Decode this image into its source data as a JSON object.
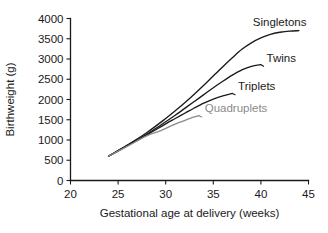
{
  "chart_data": {
    "type": "line",
    "title": "",
    "xlabel": "Gestational age at delivery (weeks)",
    "ylabel": "Birthweight (g)",
    "xlim": [
      20,
      45
    ],
    "ylim": [
      0,
      4000
    ],
    "xticks": [
      "20",
      "25",
      "30",
      "35",
      "40",
      "45"
    ],
    "yticks": [
      "0",
      "500",
      "1000",
      "1500",
      "2000",
      "2500",
      "3000",
      "3500",
      "4000"
    ],
    "grid": false,
    "legend_position": "inline-end-of-line-labels",
    "series": [
      {
        "name": "Singletons",
        "color": "#1a1a1a",
        "label_color": "#1a1a1a",
        "x": [
          24,
          26,
          28,
          30,
          31,
          32,
          33,
          34,
          35,
          36,
          37,
          38,
          39,
          40,
          41,
          42,
          43,
          44
        ],
        "values": [
          600,
          880,
          1180,
          1530,
          1720,
          1920,
          2130,
          2350,
          2580,
          2810,
          3030,
          3240,
          3400,
          3520,
          3610,
          3660,
          3690,
          3700
        ]
      },
      {
        "name": "Twins",
        "color": "#1a1a1a",
        "label_color": "#1a1a1a",
        "x": [
          24,
          26,
          28,
          30,
          31,
          32,
          33,
          34,
          35,
          36,
          37,
          38,
          39,
          40
        ],
        "values": [
          600,
          870,
          1140,
          1450,
          1610,
          1780,
          1950,
          2120,
          2290,
          2450,
          2600,
          2730,
          2820,
          2860
        ]
      },
      {
        "name": "Triplets",
        "color": "#1a1a1a",
        "label_color": "#1a1a1a",
        "x": [
          24,
          26,
          28,
          30,
          31,
          32,
          33,
          34,
          35,
          36,
          37
        ],
        "values": [
          600,
          860,
          1120,
          1400,
          1530,
          1660,
          1790,
          1910,
          2010,
          2090,
          2150
        ]
      },
      {
        "name": "Quadruplets",
        "color": "#8a8a8a",
        "label_color": "#8a8a8a",
        "x": [
          24,
          26,
          28,
          29.5,
          30.5,
          31.5,
          32.5,
          33.5
        ],
        "values": [
          600,
          850,
          1100,
          1230,
          1340,
          1440,
          1530,
          1600
        ]
      }
    ],
    "annotations": [
      {
        "text": "Singletons",
        "for": "Singletons",
        "x": 44.0,
        "y": 3980
      },
      {
        "text": "Twins",
        "for": "Twins",
        "x": 40.6,
        "y": 2930
      },
      {
        "text": "Triplets",
        "for": "Triplets",
        "x": 37.6,
        "y": 2230
      },
      {
        "text": "Quadruplets",
        "for": "Quadruplets",
        "x": 34.1,
        "y": 1680
      }
    ]
  }
}
